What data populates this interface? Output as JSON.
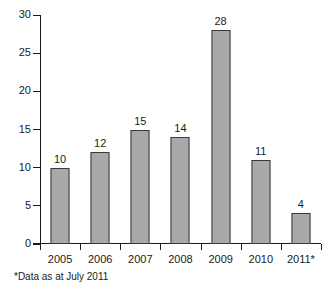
{
  "chart_data": {
    "type": "bar",
    "title": "",
    "subtitle": "",
    "xlabel": "",
    "ylabel": "",
    "categories": [
      "2005",
      "2006",
      "2007",
      "2008",
      "2009",
      "2010",
      "2011*"
    ],
    "values": [
      10,
      12,
      15,
      14,
      28,
      11,
      4
    ],
    "series": [
      {
        "name": "",
        "values": [
          10,
          12,
          15,
          14,
          28,
          11,
          4
        ]
      }
    ],
    "data_labels": [
      "10",
      "12",
      "15",
      "14",
      "28",
      "11",
      "4"
    ],
    "ylim": [
      0,
      30
    ],
    "ytick_values": [
      0,
      5,
      10,
      15,
      20,
      25,
      30
    ],
    "ytick_labels": [
      "0",
      "5",
      "10",
      "15",
      "20",
      "25",
      "30"
    ],
    "grid": false,
    "legend": false,
    "legend_position": "none",
    "annotations": [
      "*Data as at July 2011"
    ],
    "colors": {
      "bar_fill": "#a9a9a9",
      "bar_border": "#3a3a3a",
      "axis": "#1a1a1a",
      "text": "#1a1a1a",
      "background": "#ffffff"
    }
  },
  "footnote": {
    "text": "*Data as at July 2011"
  }
}
